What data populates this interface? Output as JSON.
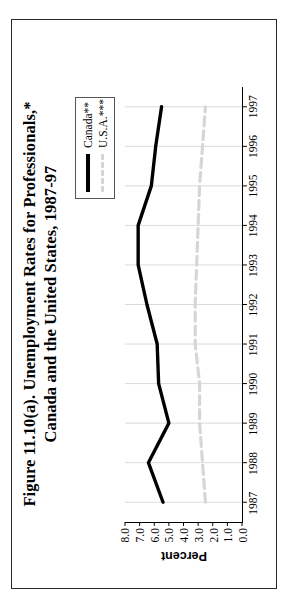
{
  "figure": {
    "title_line1": "Figure 11.10(a). Unemployment Rates for Professionals,*",
    "title_line2": "Canada and the United States, 1987-97"
  },
  "legend": {
    "position": "top-right",
    "entries": [
      {
        "label": "Canada**",
        "color": "#000000",
        "style": "solid"
      },
      {
        "label": "U.S.A.***",
        "color": "#d6d6d6",
        "style": "dashed"
      }
    ]
  },
  "chart_data": {
    "type": "line",
    "title": "Figure 11.10(a). Unemployment Rates for Professionals,* Canada and the United States, 1987-97",
    "xlabel": "",
    "ylabel": "Percent",
    "categories": [
      "1987",
      "1988",
      "1989",
      "1990",
      "1991",
      "1992",
      "1993",
      "1994",
      "1995",
      "1996",
      "1997"
    ],
    "x": [
      1987,
      1988,
      1989,
      1990,
      1991,
      1992,
      1993,
      1994,
      1995,
      1996,
      1997
    ],
    "series": [
      {
        "name": "Canada**",
        "color": "#000000",
        "style": "solid",
        "values": [
          5.4,
          6.4,
          5.0,
          5.7,
          5.8,
          6.5,
          7.1,
          7.1,
          6.2,
          5.9,
          5.5
        ]
      },
      {
        "name": "U.S.A.***",
        "color": "#d6d6d6",
        "style": "dashed",
        "values": [
          2.5,
          2.7,
          2.9,
          2.9,
          3.2,
          3.2,
          3.1,
          3.0,
          2.9,
          2.7,
          2.5
        ]
      }
    ],
    "ylim": [
      0.0,
      8.0
    ],
    "yticks": [
      "0.0",
      "1.0",
      "2.0",
      "3.0",
      "4.0",
      "5.0",
      "6.0",
      "7.0",
      "8.0"
    ],
    "ytick_values": [
      0.0,
      1.0,
      2.0,
      3.0,
      4.0,
      5.0,
      6.0,
      7.0,
      8.0
    ],
    "grid": "vertical-category-lines",
    "legend_position": "top-right",
    "rotation": "figure rotated 90 degrees counter-clockwise"
  }
}
